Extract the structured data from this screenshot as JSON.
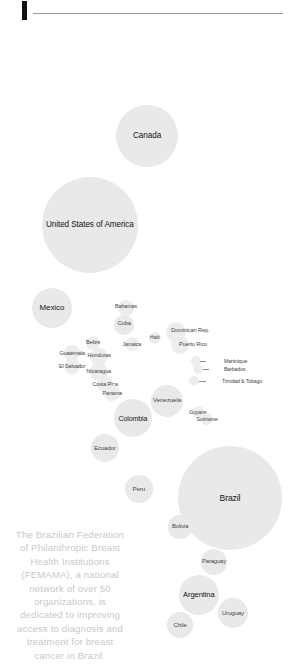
{
  "header": {
    "accent_color": "#111111",
    "divider_color": "#9a9a9a"
  },
  "caption": {
    "text": "The Brazilian Federation of Philanthropic Breast Health Institutions (FEMAMA), a national network of over 50 organizations, is dedicated to improving access to diagnosis and treatment for breast cancer in Brazil.",
    "color": "#c9c9c9"
  },
  "chart_data": {
    "type": "scatter",
    "title": "",
    "subtitle": "",
    "xlabel": "",
    "ylabel": "",
    "legend_position": "none",
    "grid": false,
    "bubble_color": "#e3e3e3",
    "label_color": "#1c1c1c",
    "note": "Cartogram-style bubble map of the Americas; bubble area encodes country magnitude.",
    "points": [
      {
        "name": "Canada",
        "cx": 147,
        "cy": 136,
        "r": 31,
        "fs": 8.2,
        "lx": 147,
        "ly": 136,
        "anchor": "center",
        "shade": "light"
      },
      {
        "name": "United States of America",
        "cx": 90,
        "cy": 225,
        "r": 48,
        "fs": 8.2,
        "lx": 90,
        "ly": 225,
        "anchor": "center",
        "shade": "light"
      },
      {
        "name": "Mexico",
        "cx": 52,
        "cy": 308,
        "r": 20,
        "fs": 8.0,
        "lx": 52,
        "ly": 308,
        "anchor": "center",
        "shade": "light"
      },
      {
        "name": "Bahamas",
        "cx": 126,
        "cy": 308,
        "r": 8,
        "fs": 5.4,
        "lx": 126,
        "ly": 306,
        "anchor": "center",
        "shade": "faint"
      },
      {
        "name": "Cuba",
        "cx": 124,
        "cy": 325,
        "r": 10,
        "fs": 5.8,
        "lx": 124,
        "ly": 324,
        "anchor": "center",
        "shade": "light"
      },
      {
        "name": "Haiti",
        "cx": 155,
        "cy": 338,
        "r": 6,
        "fs": 5.0,
        "lx": 155,
        "ly": 337,
        "anchor": "center",
        "shade": "faint"
      },
      {
        "name": "Jamaica",
        "cx": 132,
        "cy": 344,
        "r": 7,
        "fs": 5.2,
        "lx": 132,
        "ly": 344,
        "anchor": "center",
        "shade": "faint"
      },
      {
        "name": "Dominican Rep.",
        "cx": 176,
        "cy": 332,
        "r": 10,
        "fs": 5.6,
        "lx": 190,
        "ly": 331,
        "anchor": "center",
        "shade": "faint"
      },
      {
        "name": "Puerto Rico",
        "cx": 180,
        "cy": 345,
        "r": 9,
        "fs": 5.6,
        "lx": 193,
        "ly": 345,
        "anchor": "center",
        "shade": "faint"
      },
      {
        "name": "Belize",
        "cx": 93,
        "cy": 343,
        "r": 7,
        "fs": 5.4,
        "lx": 93,
        "ly": 342,
        "anchor": "center",
        "shade": "faint"
      },
      {
        "name": "Guatemala",
        "cx": 72,
        "cy": 353,
        "r": 8,
        "fs": 5.4,
        "lx": 72,
        "ly": 353,
        "anchor": "center",
        "shade": "faint"
      },
      {
        "name": "Honduras",
        "cx": 99,
        "cy": 357,
        "r": 9,
        "fs": 5.6,
        "lx": 99,
        "ly": 356,
        "anchor": "center",
        "shade": "faint"
      },
      {
        "name": "El Salvador",
        "cx": 72,
        "cy": 366,
        "r": 8,
        "fs": 5.4,
        "lx": 72,
        "ly": 366,
        "anchor": "center",
        "shade": "faint"
      },
      {
        "name": "Nicaragua",
        "cx": 99,
        "cy": 372,
        "r": 9,
        "fs": 5.6,
        "lx": 99,
        "ly": 372,
        "anchor": "center",
        "shade": "faint"
      },
      {
        "name": "Costa Rica",
        "cx": 105,
        "cy": 384,
        "r": 8,
        "fs": 5.4,
        "lx": 105,
        "ly": 384,
        "anchor": "center",
        "shade": "faint"
      },
      {
        "name": "Panama",
        "cx": 112,
        "cy": 393,
        "r": 8,
        "fs": 5.4,
        "lx": 112,
        "ly": 393,
        "anchor": "center",
        "shade": "faint"
      },
      {
        "name": "Martinique",
        "cx": 196,
        "cy": 361,
        "r": 5,
        "fs": 5.2,
        "lx": 224,
        "ly": 361,
        "anchor": "left",
        "shade": "faint",
        "leader": {
          "x": 200,
          "y": 361,
          "w": 6
        }
      },
      {
        "name": "Barbados",
        "cx": 198,
        "cy": 369,
        "r": 5,
        "fs": 5.2,
        "lx": 224,
        "ly": 369,
        "anchor": "left",
        "shade": "faint",
        "leader": {
          "x": 203,
          "y": 369,
          "w": 6
        }
      },
      {
        "name": "Trinidad & Tobago",
        "cx": 194,
        "cy": 381,
        "r": 5,
        "fs": 5.2,
        "lx": 222,
        "ly": 381,
        "anchor": "left",
        "shade": "faint",
        "leader": {
          "x": 199,
          "y": 381,
          "w": 7
        }
      },
      {
        "name": "Venezuela",
        "cx": 167,
        "cy": 401,
        "r": 16,
        "fs": 6.2,
        "lx": 167,
        "ly": 400,
        "anchor": "center",
        "shade": "light"
      },
      {
        "name": "Colombia",
        "cx": 133,
        "cy": 418,
        "r": 19,
        "fs": 7.0,
        "lx": 133,
        "ly": 418,
        "anchor": "center",
        "shade": "light"
      },
      {
        "name": "Guyana",
        "cx": 198,
        "cy": 412,
        "r": 6,
        "fs": 5.2,
        "lx": 198,
        "ly": 412,
        "anchor": "center",
        "shade": "faint"
      },
      {
        "name": "Suriname",
        "cx": 207,
        "cy": 419,
        "r": 6,
        "fs": 5.2,
        "lx": 207,
        "ly": 419,
        "anchor": "center",
        "shade": "faint"
      },
      {
        "name": "Ecuador",
        "cx": 105,
        "cy": 448,
        "r": 14,
        "fs": 6.0,
        "lx": 105,
        "ly": 448,
        "anchor": "center",
        "shade": "light"
      },
      {
        "name": "Peru",
        "cx": 139,
        "cy": 489,
        "r": 14,
        "fs": 6.2,
        "lx": 139,
        "ly": 489,
        "anchor": "center",
        "shade": "light"
      },
      {
        "name": "Brazil",
        "cx": 230,
        "cy": 498,
        "r": 52,
        "fs": 8.6,
        "lx": 230,
        "ly": 498,
        "anchor": "center",
        "shade": "light"
      },
      {
        "name": "Bolivia",
        "cx": 180,
        "cy": 527,
        "r": 12,
        "fs": 5.8,
        "lx": 180,
        "ly": 527,
        "anchor": "center",
        "shade": "light"
      },
      {
        "name": "Paraguay",
        "cx": 214,
        "cy": 562,
        "r": 13,
        "fs": 5.8,
        "lx": 214,
        "ly": 562,
        "anchor": "center",
        "shade": "light"
      },
      {
        "name": "Argentina",
        "cx": 199,
        "cy": 595,
        "r": 20,
        "fs": 7.6,
        "lx": 199,
        "ly": 595,
        "anchor": "center",
        "shade": "light"
      },
      {
        "name": "Uruguay",
        "cx": 233,
        "cy": 613,
        "r": 15,
        "fs": 6.0,
        "lx": 233,
        "ly": 613,
        "anchor": "center",
        "shade": "light"
      },
      {
        "name": "Chile",
        "cx": 180,
        "cy": 625,
        "r": 13,
        "fs": 6.0,
        "lx": 180,
        "ly": 625,
        "anchor": "center",
        "shade": "light"
      }
    ]
  }
}
